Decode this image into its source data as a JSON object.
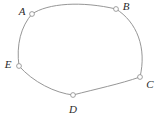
{
  "figure": {
    "type": "closed-curve-diagram",
    "width": 161,
    "height": 120,
    "background_color": "#ffffff",
    "stroke_color": "#8a8a8a",
    "label_color": "#2b2b2b",
    "marker_fill": "#ffffff",
    "marker_radius": 2.4,
    "vertices": [
      {
        "id": "A",
        "label": "A",
        "x": 32,
        "y": 14,
        "label_x": 22,
        "label_y": 12,
        "label_anchor": "middle"
      },
      {
        "id": "B",
        "label": "B",
        "x": 116,
        "y": 9,
        "label_x": 126,
        "label_y": 7,
        "label_anchor": "middle"
      },
      {
        "id": "C",
        "label": "C",
        "x": 140,
        "y": 77,
        "label_x": 150,
        "label_y": 85,
        "label_anchor": "middle"
      },
      {
        "id": "D",
        "label": "D",
        "x": 73,
        "y": 95,
        "label_x": 73,
        "label_y": 110,
        "label_anchor": "middle"
      },
      {
        "id": "E",
        "label": "E",
        "x": 19,
        "y": 66,
        "label_x": 8,
        "label_y": 65,
        "label_anchor": "middle"
      }
    ],
    "edges": [
      {
        "from": "A",
        "to": "B",
        "path": "M 32 14 C 48 3, 82 1, 116 9"
      },
      {
        "from": "B",
        "to": "C",
        "path": "M 116 9 C 137 22, 147 48, 140 77"
      },
      {
        "from": "C",
        "to": "D",
        "path": "M 140 77 C 120 84, 96 89, 73 95"
      },
      {
        "from": "D",
        "to": "E",
        "path": "M 73 95 C 55 93, 33 82, 19 66"
      },
      {
        "from": "E",
        "to": "A",
        "path": "M 19 66 C 16 45, 21 26, 32 14"
      }
    ]
  }
}
